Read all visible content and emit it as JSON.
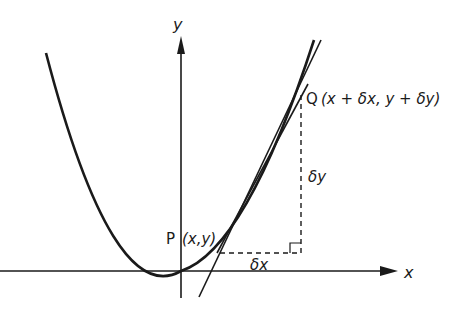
{
  "diagram": {
    "axes": {
      "x_label": "x",
      "y_label": "y"
    },
    "points": {
      "P": {
        "label": "P",
        "coords": "(x,y)"
      },
      "Q": {
        "label": "Q",
        "coords": "(x + δx, y + δy)"
      }
    },
    "increments": {
      "dx": "δx",
      "dy": "δy"
    },
    "elements": [
      "parabola y = x^2 style curve",
      "chord PQ",
      "tangent at P",
      "dashed right-angle triangle"
    ],
    "colors": {
      "ink": "#1a1a1a",
      "background": "#ffffff"
    }
  }
}
